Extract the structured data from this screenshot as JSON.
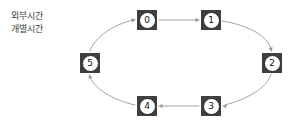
{
  "diagram": {
    "type": "cycle-graph",
    "background_color": "#ffffff",
    "annotations": [
      {
        "id": "external-time",
        "text": "외부시간"
      },
      {
        "id": "individual-time",
        "text": "개별시간"
      }
    ],
    "node_style": {
      "square_fill": "#3f3f3f",
      "disc_fill": "#ffffff",
      "disc_stroke": "#2b2b2b",
      "label_color": "#111111"
    },
    "edge_style": {
      "stroke": "#9a9a9a",
      "stroke_width": 0.9,
      "arrow_fill": "#9a9a9a"
    },
    "nodes": [
      {
        "id": "node-0",
        "label": "0",
        "x": 137,
        "y": 10
      },
      {
        "id": "node-1",
        "label": "1",
        "x": 201,
        "y": 10
      },
      {
        "id": "node-2",
        "label": "2",
        "x": 262,
        "y": 53
      },
      {
        "id": "node-3",
        "label": "3",
        "x": 201,
        "y": 96
      },
      {
        "id": "node-4",
        "label": "4",
        "x": 137,
        "y": 96
      },
      {
        "id": "node-5",
        "label": "5",
        "x": 80,
        "y": 53
      }
    ],
    "edges": [
      {
        "id": "edge-0-1",
        "from": "0",
        "to": "1",
        "shape": "straight",
        "path": "M 159 20 L 197 20",
        "arrow": {
          "x": 200,
          "y": 20,
          "rot": 0
        }
      },
      {
        "id": "edge-1-2",
        "from": "1",
        "to": "2",
        "shape": "curve",
        "path": "M 222 21 C 248 25, 268 36, 271 49",
        "arrow": {
          "x": 271.6,
          "y": 52,
          "rot": 78
        }
      },
      {
        "id": "edge-2-3",
        "from": "2",
        "to": "3",
        "shape": "curve",
        "path": "M 271 74 C 268 87, 248 99, 225 105",
        "arrow": {
          "x": 222,
          "y": 105.6,
          "rot": 192
        }
      },
      {
        "id": "edge-3-4",
        "from": "3",
        "to": "4",
        "shape": "straight",
        "path": "M 199 106 L 161 106",
        "arrow": {
          "x": 158,
          "y": 106,
          "rot": 180
        }
      },
      {
        "id": "edge-4-5",
        "from": "4",
        "to": "5",
        "shape": "curve",
        "path": "M 135 105 C 112 100, 94 88, 90 77",
        "arrow": {
          "x": 89,
          "y": 74,
          "rot": 250
        }
      },
      {
        "id": "edge-5-0",
        "from": "5",
        "to": "0",
        "shape": "curve",
        "path": "M 90 51 C 94 38, 112 25, 133 20",
        "arrow": {
          "x": 136,
          "y": 19.4,
          "rot": 348
        }
      }
    ]
  }
}
